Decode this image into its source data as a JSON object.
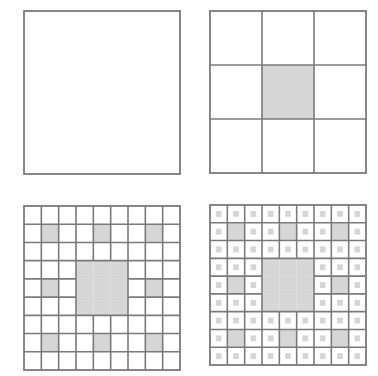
{
  "diagram": {
    "colors": {
      "stroke": "#7a7a7a",
      "fill_removed": "#d6d6d6",
      "background": "#ffffff"
    },
    "panels": [
      {
        "name": "iteration-0",
        "iteration": 0,
        "grid": 1,
        "position": "top-left"
      },
      {
        "name": "iteration-1",
        "iteration": 1,
        "grid": 3,
        "position": "top-right"
      },
      {
        "name": "iteration-2",
        "iteration": 2,
        "grid": 9,
        "position": "bottom-left"
      },
      {
        "name": "iteration-3",
        "iteration": 3,
        "grid": 9,
        "position": "bottom-right",
        "subcell_dots": true
      }
    ]
  }
}
